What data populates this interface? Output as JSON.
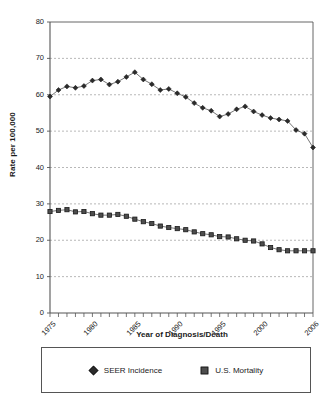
{
  "chart_data": {
    "type": "line",
    "title": "",
    "xlabel": "Year of Diagnosis/Death",
    "ylabel": "Rate per 100,000",
    "ylim": [
      0,
      80
    ],
    "ytick_labels": [
      "0",
      "10",
      "20",
      "30",
      "40",
      "50",
      "60",
      "70",
      "80"
    ],
    "yticks": [
      0,
      10,
      20,
      30,
      40,
      50,
      60,
      70,
      80
    ],
    "xlim": [
      1975,
      2006
    ],
    "xtick_labels": [
      "1975",
      "1980",
      "1985",
      "1990",
      "1995",
      "2000",
      "2006"
    ],
    "xticks": [
      1975,
      1980,
      1985,
      1990,
      1995,
      2000,
      2006
    ],
    "grid": "horizontal-dashed",
    "legend_position": "bottom",
    "x": [
      1975,
      1976,
      1977,
      1978,
      1979,
      1980,
      1981,
      1982,
      1983,
      1984,
      1985,
      1986,
      1987,
      1988,
      1989,
      1990,
      1991,
      1992,
      1993,
      1994,
      1995,
      1996,
      1997,
      1998,
      1999,
      2000,
      2001,
      2002,
      2003,
      2004,
      2005,
      2006
    ],
    "series": [
      {
        "name": "SEER Incidence",
        "marker": "diamond",
        "color": "#2b2b2b",
        "values": [
          59.5,
          61.3,
          62.3,
          61.9,
          62.4,
          63.9,
          64.2,
          62.8,
          63.6,
          64.9,
          66.2,
          64.2,
          62.9,
          61.3,
          61.6,
          60.4,
          59.4,
          57.7,
          56.4,
          55.6,
          54.0,
          54.7,
          56.0,
          56.8,
          55.4,
          54.4,
          53.6,
          53.2,
          52.8,
          50.3,
          49.3,
          45.5
        ]
      },
      {
        "name": "U.S. Mortality",
        "marker": "square",
        "color": "#4d4d4d",
        "values": [
          27.9,
          28.2,
          28.4,
          27.8,
          27.9,
          27.3,
          26.9,
          26.9,
          27.1,
          26.6,
          25.8,
          25.1,
          24.6,
          23.9,
          23.5,
          23.2,
          22.9,
          22.3,
          21.8,
          21.5,
          21.0,
          20.9,
          20.4,
          20.0,
          19.8,
          19.0,
          18.0,
          17.4,
          17.1,
          17.1,
          17.1,
          17.1
        ]
      }
    ]
  },
  "legend": {
    "entries": [
      {
        "label": "SEER Incidence",
        "marker": "diamond"
      },
      {
        "label": "U.S. Mortality",
        "marker": "square"
      }
    ]
  }
}
